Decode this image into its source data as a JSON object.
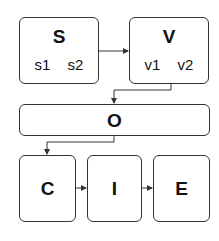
{
  "nodes": {
    "s": {
      "label": "S",
      "items": [
        "s1",
        "s2"
      ]
    },
    "v": {
      "label": "V",
      "items": [
        "v1",
        "v2"
      ]
    },
    "o": {
      "label": "O"
    },
    "c": {
      "label": "C"
    },
    "i": {
      "label": "I"
    },
    "e": {
      "label": "E"
    }
  },
  "edges": [
    {
      "from": "S",
      "to": "V"
    },
    {
      "from": "V",
      "to": "O"
    },
    {
      "from": "O",
      "to": "C"
    },
    {
      "from": "C",
      "to": "I"
    },
    {
      "from": "I",
      "to": "E"
    }
  ],
  "colors": {
    "stroke": "#333333",
    "fill": "#ffffff"
  }
}
